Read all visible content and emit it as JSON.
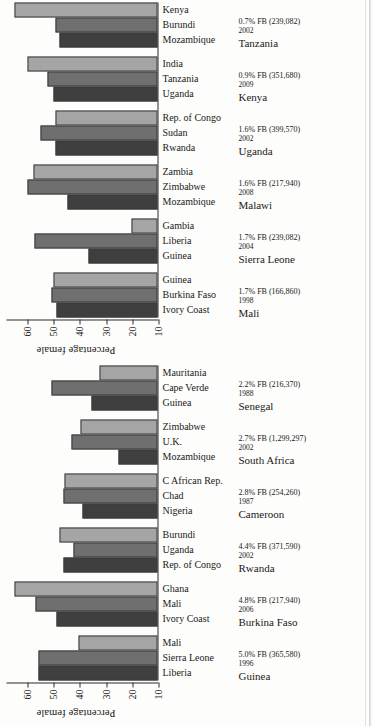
{
  "figure": {
    "orientation": "rotated-90",
    "axis_label": "Percentage female",
    "tick_labels": [
      "10",
      "20",
      "30",
      "40",
      "50",
      "60"
    ],
    "colors": {
      "series1": "#3f3f3f",
      "series2": "#6f6f6f",
      "series3": "#a5a5a5"
    }
  },
  "chart_data": [
    {
      "type": "bar",
      "title": "",
      "xlabel": "",
      "ylabel": "Percentage female",
      "ylim": [
        10,
        60
      ],
      "grid": false,
      "legend": "none",
      "orientation": "vertical",
      "groups": [
        {
          "survey": {
            "country": "Mali",
            "year": "1998",
            "pct": "1.7% FB (166,860)"
          },
          "categories": [
            "Ivory Coast",
            "Burkina Faso",
            "Guinea"
          ],
          "values": [
            48.5,
            50.5,
            49.5
          ]
        },
        {
          "survey": {
            "country": "Sierra Leone",
            "year": "2004",
            "pct": "1.7% FB (239,082)"
          },
          "categories": [
            "Guinea",
            "Liberia",
            "Gambia"
          ],
          "values": [
            36.5,
            57.0,
            20.0
          ]
        },
        {
          "survey": {
            "country": "Malawi",
            "year": "2008",
            "pct": "1.6% FB (217,940)"
          },
          "categories": [
            "Mozambique",
            "Zimbabwe",
            "Zambia"
          ],
          "values": [
            44.5,
            59.5,
            57.5
          ]
        },
        {
          "survey": {
            "country": "Uganda",
            "year": "2002",
            "pct": "1.6% FB (399,570)"
          },
          "categories": [
            "Rwanda",
            "Sudan",
            "Rep. of Congo"
          ],
          "values": [
            49.0,
            54.5,
            49.0
          ]
        },
        {
          "survey": {
            "country": "Kenya",
            "year": "2009",
            "pct": "0.9% FB (351,680)"
          },
          "categories": [
            "Uganda",
            "Tanzania",
            "India"
          ],
          "values": [
            49.5,
            52.0,
            59.5
          ]
        },
        {
          "survey": {
            "country": "Tanzania",
            "year": "2002",
            "pct": "0.7% FB (239,082)"
          },
          "categories": [
            "Mozambique",
            "Burundi",
            "Kenya"
          ],
          "values": [
            47.5,
            49.0,
            64.5
          ]
        }
      ]
    },
    {
      "type": "bar",
      "title": "",
      "xlabel": "",
      "ylabel": "Percentage female",
      "ylim": [
        10,
        60
      ],
      "grid": false,
      "legend": "none",
      "orientation": "vertical",
      "groups": [
        {
          "survey": {
            "country": "Guinea",
            "year": "1996",
            "pct": "5.0% FB (365,580)"
          },
          "categories": [
            "Liberia",
            "Sierra Leone",
            "Mali"
          ],
          "values": [
            55.5,
            55.5,
            40.0
          ]
        },
        {
          "survey": {
            "country": "Burkina Faso",
            "year": "2006",
            "pct": "4.8% FB (217,940)"
          },
          "categories": [
            "Ivory Coast",
            "Mali",
            "Ghana"
          ],
          "values": [
            48.5,
            56.5,
            64.5
          ]
        },
        {
          "survey": {
            "country": "Rwanda",
            "year": "2002",
            "pct": "4.4% FB (371,590)"
          },
          "categories": [
            "Rep. of Congo",
            "Uganda",
            "Burundi"
          ],
          "values": [
            46.0,
            42.0,
            47.5
          ]
        },
        {
          "survey": {
            "country": "Cameroon",
            "year": "1987",
            "pct": "2.8% FB (254,260)"
          },
          "categories": [
            "Nigeria",
            "Chad",
            "C African Rep."
          ],
          "values": [
            38.5,
            46.0,
            45.5
          ]
        },
        {
          "survey": {
            "country": "South Africa",
            "year": "2002",
            "pct": "2.7% FB (1,299,297)"
          },
          "categories": [
            "Mozambique",
            "U.K.",
            "Zimbabwe"
          ],
          "values": [
            25.0,
            43.0,
            39.5
          ]
        },
        {
          "survey": {
            "country": "Senegal",
            "year": "1988",
            "pct": "2.2% FB (216,370)"
          },
          "categories": [
            "Guinea",
            "Cape Verde",
            "Mauritania"
          ],
          "values": [
            35.0,
            50.5,
            32.0
          ]
        }
      ]
    }
  ]
}
